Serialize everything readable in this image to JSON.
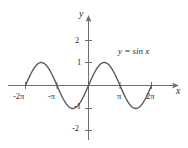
{
  "figure": {
    "kind": "math-graph",
    "background_color": "#ffffff",
    "axis_color": "#6e6e73",
    "curve_color": "#55555a",
    "text_color": "#2b2b2b"
  },
  "axes": {
    "x_axis_name": "x",
    "y_axis_name": "y",
    "x_tick_labels": [
      "-2π",
      "-π",
      "π",
      "2π"
    ],
    "y_tick_labels": [
      "2",
      "1",
      "-1",
      "-2"
    ]
  },
  "annotations": {
    "equation": "y = sin x"
  },
  "chart_data": {
    "type": "line",
    "title": "",
    "subtitle": "",
    "xlabel": "x",
    "ylabel": "y",
    "legend": [
      "y = sin x"
    ],
    "legend_position": "inline-annotation-upper-right",
    "grid": false,
    "xlim": [
      -7.2256631,
      7.5398224
    ],
    "ylim": [
      -2.6,
      2.6
    ],
    "xticks": [
      -6.2831853,
      -3.1415927,
      3.1415927,
      6.2831853
    ],
    "xticklabels": [
      "-2π",
      "-π",
      "π",
      "2π"
    ],
    "yticks": [
      2,
      1,
      -1,
      -2
    ],
    "yticklabels": [
      "2",
      "1",
      "-1",
      "-2"
    ],
    "series": [
      {
        "name": "y = sin x",
        "expression": "y = sin(x)",
        "domain": [
          -6.2831853,
          6.2831853
        ],
        "x": [
          -6.2831853,
          -5.8904862,
          -5.4977871,
          -5.1050881,
          -4.712389,
          -4.3196899,
          -3.9269908,
          -3.5342917,
          -3.1415927,
          -2.7488936,
          -2.3561945,
          -1.9634954,
          -1.5707963,
          -1.1780972,
          -0.7853982,
          -0.3926991,
          0,
          0.3926991,
          0.7853982,
          1.1780972,
          1.5707963,
          1.9634954,
          2.3561945,
          2.7488936,
          3.1415927,
          3.5342917,
          3.9269908,
          4.3196899,
          4.712389,
          5.1050881,
          5.4977871,
          5.8904862,
          6.2831853
        ],
        "y": [
          0,
          0.3826834,
          0.7071068,
          0.9238795,
          1,
          0.9238795,
          0.7071068,
          0.3826834,
          0,
          -0.3826834,
          -0.7071068,
          -0.9238795,
          -1,
          -0.9238795,
          -0.7071068,
          -0.3826834,
          0,
          0.3826834,
          0.7071068,
          0.9238795,
          1,
          0.9238795,
          0.7071068,
          0.3826834,
          0,
          -0.3826834,
          -0.7071068,
          -0.9238795,
          -1,
          -0.9238795,
          -0.7071068,
          -0.3826834,
          0
        ]
      }
    ],
    "amplitude": 1,
    "period": 6.2831853,
    "maxima_x": [
      -4.712389,
      1.5707963
    ],
    "minima_x": [
      -1.5707963,
      4.712389
    ],
    "zeros_x": [
      -6.2831853,
      -3.1415927,
      0,
      3.1415927,
      6.2831853
    ]
  }
}
